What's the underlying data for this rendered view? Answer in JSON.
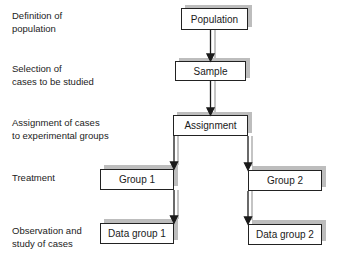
{
  "labels": [
    {
      "line1": "Definition of",
      "line2": "population"
    },
    {
      "line1": "Selection of",
      "line2": "cases to be studied"
    },
    {
      "line1": "Assignment of cases",
      "line2": "to experimental groups"
    },
    {
      "line1": "Treatment",
      "line2": ""
    },
    {
      "line1": "Observation and",
      "line2": "study of cases"
    }
  ],
  "nodes": {
    "population": "Population",
    "sample": "Sample",
    "assignment": "Assignment",
    "group1": "Group 1",
    "group2": "Group 2",
    "data_group1": "Data group 1",
    "data_group2": "Data group 2"
  },
  "colors": {
    "line": "#222222",
    "shadow": "#bdbdbd"
  }
}
